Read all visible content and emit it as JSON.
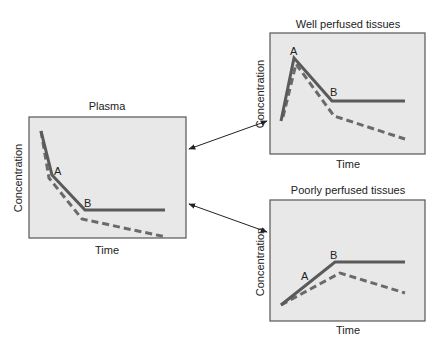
{
  "diagram": {
    "panels": [
      {
        "id": "plasma",
        "title": "Plasma",
        "xlabel": "Time",
        "ylabel": "Concentration",
        "point_labels": [
          "A",
          "B"
        ]
      },
      {
        "id": "well",
        "title": "Well perfused tissues",
        "xlabel": "Time",
        "ylabel": "Concentration",
        "point_labels": [
          "A",
          "B"
        ]
      },
      {
        "id": "poorly",
        "title": "Poorly perfused tissues",
        "xlabel": "Time",
        "ylabel": "Concentration",
        "point_labels": [
          "A",
          "B"
        ]
      }
    ],
    "connections": [
      {
        "from": "plasma",
        "to": "well",
        "type": "bidirectional-arrow"
      },
      {
        "from": "plasma",
        "to": "poorly",
        "type": "bidirectional-arrow"
      }
    ],
    "colors": {
      "panel_fill": "#e8e8e8",
      "panel_border": "#555555",
      "line": "#5a5a5a"
    }
  }
}
